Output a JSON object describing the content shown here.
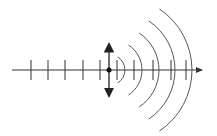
{
  "diagram": {
    "title": "",
    "colors": {
      "background": "#ffffff",
      "stroke": "#333333",
      "arc": "#555555"
    },
    "axis": {
      "x_start": 12,
      "x_end": 205,
      "y": 70,
      "arrow": "right"
    },
    "source": {
      "x": 109,
      "y": 70,
      "radius": 2.5,
      "oscillation_arrow": {
        "y_top": 42,
        "y_bottom": 98
      }
    },
    "ticks": {
      "left": [
        31,
        48,
        65,
        83,
        100
      ],
      "right": [
        117,
        134,
        153,
        171,
        186
      ],
      "half_height": 10
    },
    "wavefronts": [
      {
        "x_apex": 125,
        "half_height": 13
      },
      {
        "x_apex": 142,
        "half_height": 25
      },
      {
        "x_apex": 159,
        "half_height": 37
      },
      {
        "x_apex": 175,
        "half_height": 49
      },
      {
        "x_apex": 192,
        "half_height": 61
      }
    ]
  }
}
